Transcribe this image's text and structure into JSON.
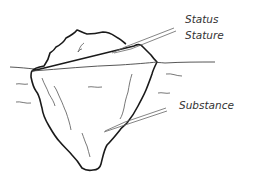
{
  "diagram": {
    "labels": {
      "above_water": [
        "Status",
        "Stature"
      ],
      "below_water": [
        "Substance"
      ]
    },
    "colors": {
      "outline": "#1a1a1a",
      "detail": "#555555",
      "text": "#333333",
      "background": "#ffffff"
    }
  }
}
